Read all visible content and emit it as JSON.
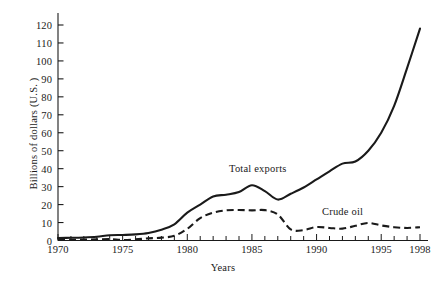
{
  "chart_data": {
    "type": "line",
    "title": "",
    "xlabel": "Years",
    "ylabel": "Billions of dollars (U.S. )",
    "xlim": [
      1970,
      1998
    ],
    "ylim": [
      0,
      125
    ],
    "grid": false,
    "legend_position": "inline-annotations",
    "xticks": [
      1970,
      1975,
      1980,
      1985,
      1990,
      1995,
      1998
    ],
    "xtick_labels": [
      "1970",
      "1975",
      "1980",
      "1985",
      "1990",
      "1995",
      "1998"
    ],
    "x_minor_tick_step": 1,
    "yticks": [
      0,
      10,
      20,
      30,
      40,
      50,
      60,
      70,
      80,
      90,
      100,
      110,
      120
    ],
    "ytick_labels": [
      "0",
      "10",
      "20",
      "30",
      "40",
      "50",
      "60",
      "70",
      "80",
      "90",
      "100",
      "110",
      "120"
    ],
    "x": [
      1970,
      1971,
      1972,
      1973,
      1974,
      1975,
      1976,
      1977,
      1978,
      1979,
      1980,
      1981,
      1982,
      1983,
      1984,
      1985,
      1986,
      1987,
      1988,
      1989,
      1990,
      1991,
      1992,
      1993,
      1994,
      1995,
      1996,
      1997,
      1998
    ],
    "series": [
      {
        "name": "Total exports",
        "style": "solid",
        "color": "#1a1a1a",
        "values": [
          1.4,
          1.5,
          1.7,
          2.1,
          2.9,
          3.1,
          3.4,
          4.2,
          6.0,
          9.0,
          15.5,
          20.0,
          24.5,
          25.5,
          27.0,
          30.8,
          27.5,
          22.8,
          26.0,
          29.5,
          34.0,
          38.5,
          42.8,
          44.0,
          50.0,
          60.0,
          75.0,
          96.0,
          118.0
        ]
      },
      {
        "name": "Crude oil",
        "style": "dashed",
        "color": "#1a1a1a",
        "values": [
          0.4,
          0.4,
          0.5,
          0.6,
          0.8,
          0.3,
          0.6,
          1.2,
          1.6,
          2.6,
          6.5,
          12.5,
          15.5,
          16.8,
          17.0,
          16.8,
          16.9,
          14.5,
          6.2,
          5.8,
          7.5,
          7.0,
          6.6,
          8.2,
          9.8,
          8.4,
          7.4,
          7.0,
          7.4
        ]
      }
    ],
    "annotations": [
      {
        "text": "Total exports",
        "x": 1984.5,
        "y": 42
      },
      {
        "text": "Crude oil",
        "x": 1992.0,
        "y": 20
      }
    ]
  }
}
